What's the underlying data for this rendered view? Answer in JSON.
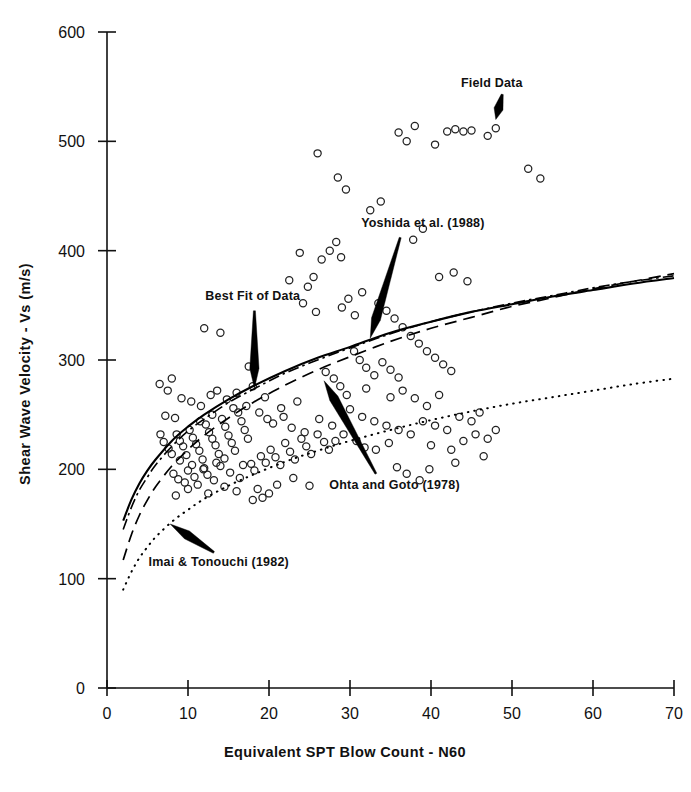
{
  "chart_data": {
    "type": "scatter",
    "title": "",
    "xlabel": "Equivalent  SPT Blow Count - N60",
    "ylabel": "Shear Wave Velocity - Vs (m/s)",
    "xlim": [
      0,
      70
    ],
    "ylim": [
      0,
      600
    ],
    "xticks": [
      0,
      10,
      20,
      30,
      40,
      50,
      60,
      70
    ],
    "yticks": [
      0,
      100,
      200,
      300,
      400,
      500,
      600
    ],
    "xtick_labels": [
      "0",
      "10",
      "20",
      "30",
      "40",
      "50",
      "60",
      "70"
    ],
    "ytick_labels": [
      "0",
      "100",
      "200",
      "300",
      "400",
      "500",
      "600"
    ],
    "grid": false,
    "legend": "none-inline-annotations",
    "marker": "open-circle",
    "points": [
      [
        7.2,
        249
      ],
      [
        8.4,
        247
      ],
      [
        6.6,
        232
      ],
      [
        7.0,
        225
      ],
      [
        7.6,
        219
      ],
      [
        8.0,
        214
      ],
      [
        8.6,
        232
      ],
      [
        9.0,
        226
      ],
      [
        9.4,
        221
      ],
      [
        9.8,
        213
      ],
      [
        10.2,
        236
      ],
      [
        10.6,
        229
      ],
      [
        11.0,
        223
      ],
      [
        11.4,
        217
      ],
      [
        11.8,
        209
      ],
      [
        12.2,
        241
      ],
      [
        12.6,
        234
      ],
      [
        13.0,
        228
      ],
      [
        13.4,
        222
      ],
      [
        13.8,
        214
      ],
      [
        14.2,
        246
      ],
      [
        14.6,
        239
      ],
      [
        15.0,
        231
      ],
      [
        15.4,
        224
      ],
      [
        15.8,
        217
      ],
      [
        16.2,
        252
      ],
      [
        16.6,
        244
      ],
      [
        17.0,
        236
      ],
      [
        17.4,
        228
      ],
      [
        9.2,
        265
      ],
      [
        10.4,
        262
      ],
      [
        11.6,
        258
      ],
      [
        12.8,
        268
      ],
      [
        13.6,
        272
      ],
      [
        14.8,
        264
      ],
      [
        16.0,
        270
      ],
      [
        8.2,
        196
      ],
      [
        8.8,
        191
      ],
      [
        9.6,
        188
      ],
      [
        10.0,
        199
      ],
      [
        10.8,
        193
      ],
      [
        11.2,
        186
      ],
      [
        12.0,
        201
      ],
      [
        12.4,
        195
      ],
      [
        13.2,
        190
      ],
      [
        14.0,
        203
      ],
      [
        15.2,
        197
      ],
      [
        16.4,
        192
      ],
      [
        17.8,
        205
      ],
      [
        18.2,
        199
      ],
      [
        19.0,
        212
      ],
      [
        19.6,
        206
      ],
      [
        20.2,
        218
      ],
      [
        20.8,
        211
      ],
      [
        21.4,
        204
      ],
      [
        22.0,
        224
      ],
      [
        22.6,
        216
      ],
      [
        23.2,
        209
      ],
      [
        24.0,
        228
      ],
      [
        24.6,
        221
      ],
      [
        25.2,
        214
      ],
      [
        26.0,
        232
      ],
      [
        26.8,
        225
      ],
      [
        27.4,
        218
      ],
      [
        18.6,
        182
      ],
      [
        20.0,
        178
      ],
      [
        21.0,
        186
      ],
      [
        23.0,
        192
      ],
      [
        25.0,
        185
      ],
      [
        19.2,
        174
      ],
      [
        12.0,
        329
      ],
      [
        14.0,
        325
      ],
      [
        17.5,
        294
      ],
      [
        18.0,
        276
      ],
      [
        19.5,
        266
      ],
      [
        21.5,
        256
      ],
      [
        23.5,
        262
      ],
      [
        6.5,
        278
      ],
      [
        7.5,
        272
      ],
      [
        8.0,
        283
      ],
      [
        27.0,
        289
      ],
      [
        28.0,
        283
      ],
      [
        28.8,
        276
      ],
      [
        29.6,
        268
      ],
      [
        30.5,
        308
      ],
      [
        31.2,
        300
      ],
      [
        32.0,
        293
      ],
      [
        33.0,
        286
      ],
      [
        34.0,
        298
      ],
      [
        35.0,
        291
      ],
      [
        36.0,
        284
      ],
      [
        29.0,
        348
      ],
      [
        29.8,
        356
      ],
      [
        30.6,
        341
      ],
      [
        31.5,
        362
      ],
      [
        26.5,
        392
      ],
      [
        27.5,
        400
      ],
      [
        28.3,
        408
      ],
      [
        28.9,
        394
      ],
      [
        25.5,
        376
      ],
      [
        33.5,
        352
      ],
      [
        34.5,
        345
      ],
      [
        35.5,
        338
      ],
      [
        36.5,
        330
      ],
      [
        37.5,
        322
      ],
      [
        38.5,
        315
      ],
      [
        39.5,
        308
      ],
      [
        40.5,
        302
      ],
      [
        41.5,
        296
      ],
      [
        42.5,
        290
      ],
      [
        23.8,
        398
      ],
      [
        24.8,
        367
      ],
      [
        22.5,
        373
      ],
      [
        24.2,
        352
      ],
      [
        25.8,
        344
      ],
      [
        28.5,
        467
      ],
      [
        29.5,
        456
      ],
      [
        26.0,
        489
      ],
      [
        32.5,
        437
      ],
      [
        33.8,
        445
      ],
      [
        36.0,
        508
      ],
      [
        37.0,
        500
      ],
      [
        38.0,
        514
      ],
      [
        40.5,
        497
      ],
      [
        42.0,
        509
      ],
      [
        43.0,
        511
      ],
      [
        44.0,
        509
      ],
      [
        45.0,
        510
      ],
      [
        47.0,
        505
      ],
      [
        48.0,
        512
      ],
      [
        52.0,
        475
      ],
      [
        53.5,
        466
      ],
      [
        39.0,
        420
      ],
      [
        37.8,
        410
      ],
      [
        41.0,
        376
      ],
      [
        42.8,
        380
      ],
      [
        44.5,
        372
      ],
      [
        30.0,
        255
      ],
      [
        31.5,
        248
      ],
      [
        33.0,
        244
      ],
      [
        34.5,
        240
      ],
      [
        36.0,
        236
      ],
      [
        37.5,
        232
      ],
      [
        39.0,
        244
      ],
      [
        40.5,
        240
      ],
      [
        42.0,
        236
      ],
      [
        43.5,
        248
      ],
      [
        45.0,
        244
      ],
      [
        46.0,
        252
      ],
      [
        38.0,
        265
      ],
      [
        39.5,
        258
      ],
      [
        41.0,
        268
      ],
      [
        36.5,
        272
      ],
      [
        35.0,
        266
      ],
      [
        32.0,
        274
      ],
      [
        40.0,
        222
      ],
      [
        42.5,
        218
      ],
      [
        44.0,
        226
      ],
      [
        45.5,
        232
      ],
      [
        47.0,
        228
      ],
      [
        48.0,
        236
      ],
      [
        43.0,
        206
      ],
      [
        46.5,
        212
      ],
      [
        39.8,
        200
      ],
      [
        37.0,
        196
      ],
      [
        38.6,
        190
      ],
      [
        35.8,
        202
      ],
      [
        20.5,
        242
      ],
      [
        21.8,
        248
      ],
      [
        22.8,
        238
      ],
      [
        24.4,
        234
      ],
      [
        26.2,
        246
      ],
      [
        27.8,
        240
      ],
      [
        17.2,
        258
      ],
      [
        18.8,
        252
      ],
      [
        19.8,
        246
      ],
      [
        15.6,
        256
      ],
      [
        13.0,
        250
      ],
      [
        11.5,
        244
      ],
      [
        9.0,
        208
      ],
      [
        10.5,
        204
      ],
      [
        11.9,
        200
      ],
      [
        13.5,
        206
      ],
      [
        14.5,
        210
      ],
      [
        16.8,
        204
      ],
      [
        18.0,
        172
      ],
      [
        16.0,
        180
      ],
      [
        14.5,
        184
      ],
      [
        12.5,
        178
      ],
      [
        10.0,
        182
      ],
      [
        8.5,
        176
      ],
      [
        30.8,
        226
      ],
      [
        31.8,
        220
      ],
      [
        29.2,
        232
      ],
      [
        28.2,
        226
      ],
      [
        33.2,
        218
      ],
      [
        34.8,
        224
      ]
    ],
    "curves": [
      {
        "name": "Best Fit of Data",
        "style": "solid",
        "x": [
          2,
          3,
          4,
          5,
          6,
          8,
          10,
          12,
          15,
          18,
          22,
          26,
          30,
          35,
          40,
          45,
          50,
          55,
          60,
          65,
          70
        ],
        "y": [
          153,
          172,
          187,
          199,
          209,
          226,
          239,
          250,
          264,
          276,
          290,
          302,
          312,
          325,
          335,
          344,
          351,
          358,
          364,
          370,
          375
        ]
      },
      {
        "name": "Yoshida et al. (1988)",
        "style": "dash-dot",
        "x": [
          2,
          3,
          4,
          5,
          6,
          8,
          10,
          12,
          15,
          18,
          22,
          26,
          30,
          35,
          40,
          45,
          50,
          55,
          60,
          65,
          70
        ],
        "y": [
          145,
          165,
          181,
          193,
          204,
          221,
          235,
          246,
          261,
          273,
          288,
          300,
          311,
          324,
          335,
          344,
          352,
          359,
          366,
          372,
          377
        ]
      },
      {
        "name": "Ohta and Goto (1978)",
        "style": "dashed",
        "x": [
          2,
          3,
          4,
          5,
          6,
          8,
          10,
          12,
          15,
          18,
          22,
          26,
          30,
          35,
          40,
          45,
          50,
          55,
          60,
          65,
          70
        ],
        "y": [
          117,
          140,
          158,
          172,
          184,
          203,
          218,
          231,
          247,
          261,
          277,
          291,
          303,
          317,
          329,
          339,
          349,
          357,
          365,
          372,
          379
        ]
      },
      {
        "name": "Imai & Tonouchi (1982)",
        "style": "dotted",
        "x": [
          2,
          3,
          4,
          5,
          6,
          8,
          10,
          12,
          15,
          18,
          22,
          26,
          30,
          35,
          40,
          45,
          50,
          55,
          60,
          65,
          70
        ],
        "y": [
          90,
          106,
          119,
          129,
          138,
          152,
          163,
          173,
          185,
          195,
          207,
          217,
          226,
          236,
          245,
          253,
          260,
          266,
          272,
          278,
          283
        ]
      }
    ],
    "annotations": [
      {
        "id": "field-data",
        "text": "Field Data",
        "text_x": 47.5,
        "text_y": 550,
        "arrow_from_x": 48.8,
        "arrow_from_y": 543,
        "arrow_to_x": 48.0,
        "arrow_to_y": 520
      },
      {
        "id": "yoshida",
        "text": "Yoshida et al. (1988)",
        "text_x": 39.0,
        "text_y": 422,
        "arrow_from_x": 36.2,
        "arrow_from_y": 412,
        "arrow_to_x": 32.5,
        "arrow_to_y": 320
      },
      {
        "id": "best-fit",
        "text": "Best Fit of Data",
        "text_x": 18.0,
        "text_y": 355,
        "arrow_from_x": 18.2,
        "arrow_from_y": 345,
        "arrow_to_x": 18.2,
        "arrow_to_y": 274
      },
      {
        "id": "ohta-goto",
        "text": "Ohta and Goto (1978)",
        "text_x": 35.5,
        "text_y": 182,
        "arrow_from_x": 33.2,
        "arrow_from_y": 196,
        "arrow_to_x": 26.8,
        "arrow_to_y": 281
      },
      {
        "id": "imai-tonouchi",
        "text": "Imai & Tonouchi (1982)",
        "text_x": 13.8,
        "text_y": 112,
        "arrow_from_x": 13.2,
        "arrow_from_y": 124,
        "arrow_to_x": 7.8,
        "arrow_to_y": 150
      }
    ]
  },
  "figure": {
    "x_axis_title": "Equivalent  SPT Blow Count - N60",
    "y_axis_title": "Shear Wave Velocity - Vs (m/s)",
    "labels": {
      "field_data": "Field Data",
      "yoshida": "Yoshida et al. (1988)",
      "best_fit": "Best Fit of Data",
      "ohta_goto": "Ohta and Goto (1978)",
      "imai_tonouchi": "Imai & Tonouchi (1982)"
    },
    "colors": {
      "ink": "#111111",
      "background": "#ffffff",
      "marker_stroke": "#222222"
    }
  }
}
